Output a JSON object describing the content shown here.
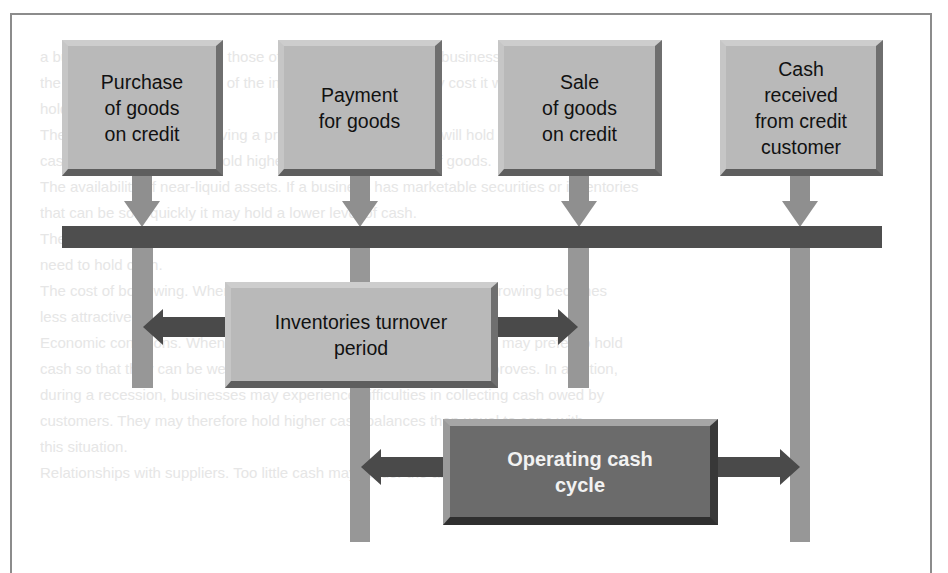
{
  "diagram": {
    "events": [
      {
        "id": "purchase",
        "label": "Purchase\nof goods\non credit"
      },
      {
        "id": "payment",
        "label": "Payment\nfor goods"
      },
      {
        "id": "sale",
        "label": "Sale\nof goods\non credit"
      },
      {
        "id": "cash_received",
        "label": "Cash\nreceived\nfrom credit\ncustomer"
      }
    ],
    "periods": [
      {
        "id": "inventories_turnover",
        "label": "Inventories turnover\nperiod",
        "spans": [
          "purchase",
          "sale"
        ]
      },
      {
        "id": "operating_cash_cycle",
        "label": "Operating cash\ncycle",
        "spans": [
          "payment",
          "cash_received"
        ]
      }
    ],
    "timeline": "Horizontal time bar linking all four events",
    "colors": {
      "light_box": "#b9b9b9",
      "dark_box": "#6b6b6b",
      "timeline_bar": "#4e4e4e",
      "pillar": "#979797",
      "arrow": "#4a4a4a"
    }
  },
  "background_bleed": {
    "lines": [
      "",
      "a business to fluctuate from those of a particular point in the business cycle. It is likely that",
      "the firm holding a high level of the inventory plan, opportunity cost it would then have to",
      "hold in the balance sheet.",
      "The nature of business. Having a product where retrieving it will hold some level of",
      "cash in. The business will hold higher levels, with this type of goods.",
      "The availability of near-liquid assets. If a business has marketable securities or inventories",
      "that can be sold quickly it may hold a lower level of cash.",
      "The availability of borrowing. If a business can borrow easily (and quickly) there is less",
      "need to hold cash.",
      "The cost of borrowing. When interest rates are high, the option of borrowing becomes",
      "less attractive.",
      "Economic conditions. When the economy is in recession, businesses may prefer to hold",
      "cash so that they can be well placed to invest when the economy improves. In addition,",
      "during a recession, businesses may experience difficulties in collecting cash owed by",
      "customers. They may therefore hold higher cash balances than usual to cope with",
      "this situation.",
      "Relationships with suppliers. Too little cash may hinder the ability of the business to pay"
    ]
  }
}
